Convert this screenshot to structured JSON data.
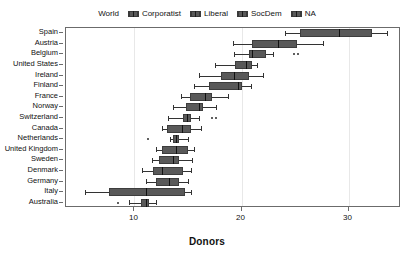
{
  "legend": {
    "first_label": "World",
    "entries": [
      {
        "label": "Corporatist",
        "icon": "boxplot-swatch-icon"
      },
      {
        "label": "Liberal",
        "icon": "boxplot-swatch-icon"
      },
      {
        "label": "SocDem",
        "icon": "boxplot-swatch-icon"
      },
      {
        "label": "NA",
        "icon": "boxplot-swatch-icon"
      }
    ]
  },
  "colors": {
    "box_fill": "#595959",
    "box_stroke": "#3d3d3d",
    "median": "#111111",
    "whisker": "#333333",
    "frame": "#6b6b6b",
    "gridline": "#e8e8e8",
    "background": "#ffffff"
  },
  "chart_data": {
    "type": "box",
    "title": "",
    "xlabel": "Donors",
    "ylabel": "",
    "xlim": [
      3.6,
      34.9
    ],
    "ylim": [
      0,
      17
    ],
    "xticks": [
      10,
      20,
      30
    ],
    "xticklabels": [
      "10",
      "20",
      "30"
    ],
    "grid": "vertical-only",
    "legend_position": "top-center",
    "orientation": "horizontal",
    "categories": [
      "Spain",
      "Austria",
      "Belgium",
      "United States",
      "Ireland",
      "Finland",
      "France",
      "Norway",
      "Switzerland",
      "Canada",
      "Netherlands",
      "United Kingdom",
      "Sweden",
      "Denmark",
      "Germany",
      "Italy",
      "Australia"
    ],
    "boxes": [
      {
        "category": "Spain",
        "group": "SocDem",
        "whisker_low": 24.1,
        "q1": 25.5,
        "median": 29.1,
        "q3": 32.2,
        "whisker_high": 33.6,
        "outliers": []
      },
      {
        "category": "Austria",
        "group": "Corporatist",
        "whisker_low": 19.2,
        "q1": 21.0,
        "median": 23.4,
        "q3": 25.2,
        "whisker_high": 27.6,
        "outliers": []
      },
      {
        "category": "Belgium",
        "group": "Corporatist",
        "whisker_low": 19.3,
        "q1": 20.7,
        "median": 21.0,
        "q3": 22.3,
        "whisker_high": 22.9,
        "outliers": [
          24.9,
          25.3
        ]
      },
      {
        "category": "United States",
        "group": "Liberal",
        "whisker_low": 17.5,
        "q1": 19.4,
        "median": 20.4,
        "q3": 21.0,
        "whisker_high": 21.4,
        "outliers": []
      },
      {
        "category": "Ireland",
        "group": "Liberal",
        "whisker_low": 16.0,
        "q1": 18.1,
        "median": 19.3,
        "q3": 20.7,
        "whisker_high": 22.0,
        "outliers": []
      },
      {
        "category": "Finland",
        "group": "SocDem",
        "whisker_low": 15.6,
        "q1": 17.0,
        "median": 19.7,
        "q3": 20.0,
        "whisker_high": 20.9,
        "outliers": []
      },
      {
        "category": "France",
        "group": "Corporatist",
        "whisker_low": 14.3,
        "q1": 15.2,
        "median": 16.6,
        "q3": 17.2,
        "whisker_high": 18.7,
        "outliers": []
      },
      {
        "category": "Norway",
        "group": "SocDem",
        "whisker_low": 13.6,
        "q1": 14.8,
        "median": 16.0,
        "q3": 16.4,
        "whisker_high": 17.6,
        "outliers": []
      },
      {
        "category": "Switzerland",
        "group": "Corporatist",
        "whisker_low": 13.1,
        "q1": 14.5,
        "median": 14.9,
        "q3": 15.3,
        "whisker_high": 16.0,
        "outliers": [
          17.2,
          17.6
        ]
      },
      {
        "category": "Canada",
        "group": "Liberal",
        "whisker_low": 12.6,
        "q1": 13.0,
        "median": 14.4,
        "q3": 15.3,
        "whisker_high": 16.2,
        "outliers": []
      },
      {
        "category": "Netherlands",
        "group": "Corporatist",
        "whisker_low": 13.3,
        "q1": 13.6,
        "median": 13.9,
        "q3": 14.2,
        "whisker_high": 15.0,
        "outliers": [
          11.3
        ]
      },
      {
        "category": "United Kingdom",
        "group": "Liberal",
        "whisker_low": 12.0,
        "q1": 12.6,
        "median": 13.9,
        "q3": 15.0,
        "whisker_high": 15.6,
        "outliers": []
      },
      {
        "category": "Sweden",
        "group": "SocDem",
        "whisker_low": 11.6,
        "q1": 12.3,
        "median": 13.6,
        "q3": 14.2,
        "whisker_high": 15.4,
        "outliers": []
      },
      {
        "category": "Denmark",
        "group": "SocDem",
        "whisker_low": 10.7,
        "q1": 11.7,
        "median": 12.6,
        "q3": 14.5,
        "whisker_high": 15.3,
        "outliers": []
      },
      {
        "category": "Germany",
        "group": "Corporatist",
        "whisker_low": 11.1,
        "q1": 12.0,
        "median": 13.2,
        "q3": 14.2,
        "whisker_high": 15.0,
        "outliers": []
      },
      {
        "category": "Italy",
        "group": "Corporatist",
        "whisker_low": 5.4,
        "q1": 7.6,
        "median": 11.1,
        "q3": 14.7,
        "whisker_high": 15.3,
        "outliers": []
      },
      {
        "category": "Australia",
        "group": "Liberal",
        "whisker_low": 9.5,
        "q1": 10.6,
        "median": 11.1,
        "q3": 11.4,
        "whisker_high": 12.0,
        "outliers": [
          8.5
        ]
      }
    ]
  }
}
